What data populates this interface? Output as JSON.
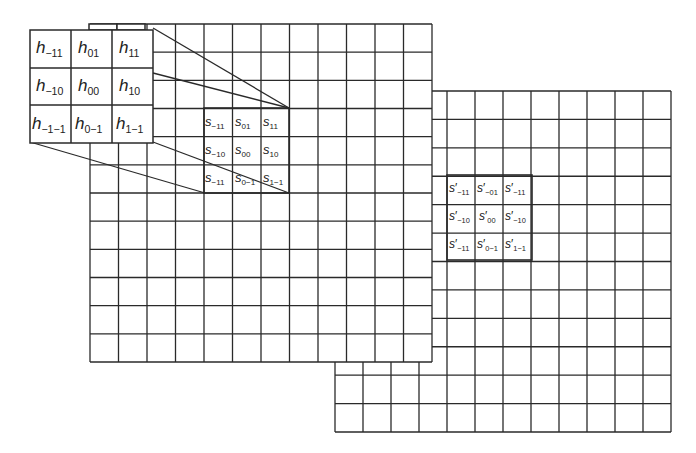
{
  "diagram": {
    "kernel": {
      "symbol": "h",
      "cells": [
        [
          "-11",
          "01",
          "11"
        ],
        [
          "-10",
          "00",
          "10"
        ],
        [
          "-1-1",
          "0-1",
          "1-1"
        ]
      ]
    },
    "input_patch": {
      "symbol": "s",
      "cells": [
        [
          "-11",
          "01",
          "11"
        ],
        [
          "-10",
          "00",
          "10"
        ],
        [
          "-11",
          "0-1",
          "1-1"
        ]
      ]
    },
    "output_patch": {
      "symbol": "s",
      "prime": "′",
      "cells": [
        [
          "-11",
          "-01",
          "-11"
        ],
        [
          "-10",
          "00",
          "-10"
        ],
        [
          "-11",
          "0-1",
          "1-1"
        ]
      ]
    },
    "input_grid": {
      "rows": 12,
      "cols": 12
    },
    "output_grid": {
      "rows": 12,
      "cols": 12
    },
    "line_color": "#2a2a2a",
    "background": "#ffffff"
  }
}
